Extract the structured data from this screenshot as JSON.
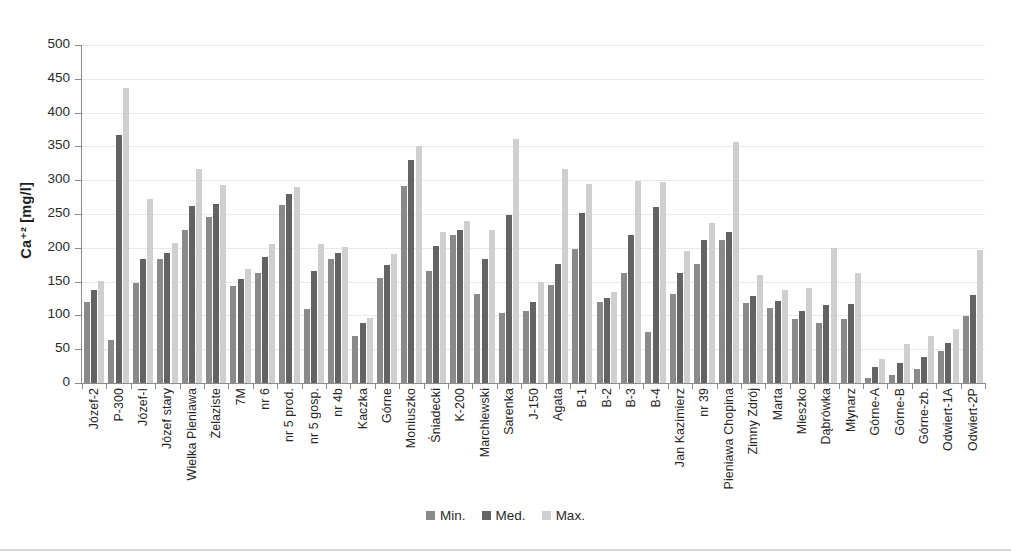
{
  "chart_data": {
    "type": "bar",
    "title": "",
    "xlabel": "",
    "ylabel": "Ca⁺² [mg/l]",
    "ylim": [
      0,
      500
    ],
    "ytick_step": 50,
    "yticks": [
      500,
      450,
      400,
      350,
      300,
      250,
      200,
      150,
      100,
      50,
      0
    ],
    "grid": true,
    "legend_position": "bottom-center",
    "categories": [
      "Józef-2",
      "P-300",
      "Józef-I",
      "Józef stary",
      "Wielka Pieniawa",
      "Żelaziste",
      "7M",
      "nr 6",
      "nr 5 prod.",
      "nr 5 gosp.",
      "nr 4b",
      "Kaczka",
      "Górne",
      "Moniuszko",
      "Śniadecki",
      "K-200",
      "Marchlewski",
      "Sarenka",
      "J-150",
      "Agata",
      "B-1",
      "B-2",
      "B-3",
      "B-4",
      "Jan Kazimierz",
      "nr 39",
      "Pieniawa Chopina",
      "Zimny Zdrój",
      "Marta",
      "Mieszko",
      "Dąbrówka",
      "Młynarz",
      "Górne-A",
      "Górne-B",
      "Górne-zb.",
      "Odwiert-1A",
      "Odwiert-2P"
    ],
    "series": [
      {
        "name": "Min.",
        "color": "#8a8a8a",
        "values": [
          120,
          63,
          148,
          184,
          227,
          245,
          144,
          163,
          264,
          110,
          184,
          70,
          156,
          292,
          165,
          219,
          131,
          104,
          106,
          145,
          198,
          120,
          163,
          75,
          131,
          176,
          211,
          119,
          111,
          94,
          89,
          94,
          8,
          12,
          21,
          48,
          99
        ]
      },
      {
        "name": "Med.",
        "color": "#636363",
        "values": [
          138,
          367,
          184,
          192,
          262,
          265,
          154,
          187,
          279,
          165,
          192,
          89,
          175,
          330,
          203,
          227,
          183,
          249,
          120,
          176,
          252,
          126,
          219,
          260,
          163,
          211,
          224,
          128,
          122,
          106,
          116,
          117,
          24,
          29,
          38,
          59,
          130
        ]
      },
      {
        "name": "Max.",
        "color": "#cfcfcf",
        "values": [
          151,
          437,
          272,
          207,
          317,
          293,
          168,
          206,
          290,
          206,
          201,
          96,
          191,
          351,
          223,
          240,
          227,
          361,
          150,
          317,
          294,
          135,
          299,
          297,
          196,
          237,
          356,
          160,
          138,
          141,
          200,
          163,
          36,
          58,
          69,
          80,
          197
        ]
      }
    ]
  },
  "legend": {
    "items": [
      {
        "label": "Min.",
        "color": "#8a8a8a"
      },
      {
        "label": "Med.",
        "color": "#636363"
      },
      {
        "label": "Max.",
        "color": "#cfcfcf"
      }
    ]
  }
}
